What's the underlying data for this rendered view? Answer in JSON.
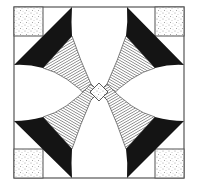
{
  "figure": {
    "colors": {
      "background": "#ffffff",
      "line": "#3a3a3a",
      "solid": "#141414",
      "hatch": "#555555",
      "stipple": "#9a9a9a"
    },
    "frame": {
      "x": 14,
      "y": 7,
      "width": 170,
      "height": 171
    },
    "corner_square_size": 29,
    "center": {
      "x": 99,
      "y": 92
    },
    "center_diamond_half": 8
  }
}
